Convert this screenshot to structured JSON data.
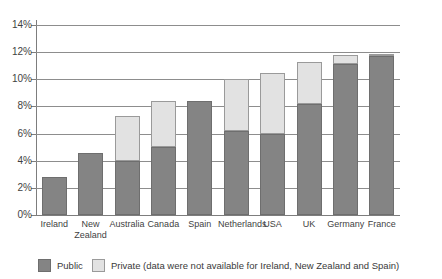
{
  "chart_data": {
    "type": "bar",
    "subtype": "stacked-bar",
    "title": "",
    "xlabel": "",
    "ylabel": "",
    "ylim": [
      0,
      14
    ],
    "ytick_step": 2,
    "ytick_labels": [
      "0%",
      "2%",
      "4%",
      "6%",
      "8%",
      "10%",
      "12%",
      "14%"
    ],
    "ytick_values": [
      0,
      2,
      4,
      6,
      8,
      10,
      12,
      14
    ],
    "grid": true,
    "legend_position": "bottom-left",
    "categories": [
      "Ireland",
      "New Zealand",
      "Australia",
      "Canada",
      "Spain",
      "Netherlands",
      "USA",
      "UK",
      "Germany",
      "France"
    ],
    "series": [
      {
        "name": "Public",
        "color": "#848484",
        "values": [
          2.8,
          4.6,
          4.0,
          5.0,
          8.4,
          6.2,
          6.0,
          8.2,
          11.1,
          11.7
        ]
      },
      {
        "name": "Private",
        "color": "#e2e2e2",
        "values": [
          0,
          0,
          3.3,
          3.4,
          0,
          3.8,
          4.5,
          3.1,
          0.7,
          0.15
        ]
      }
    ],
    "totals": [
      2.8,
      4.6,
      7.3,
      8.4,
      8.4,
      10.0,
      10.5,
      11.3,
      11.8,
      11.85
    ]
  },
  "legend": {
    "items": [
      {
        "label": "Public",
        "swatch": "public-swatch"
      },
      {
        "label": "Private (data were not available for Ireland, New Zealand and Spain)",
        "swatch": "private-swatch"
      }
    ]
  },
  "colors": {
    "public": "#848484",
    "private": "#e2e2e2",
    "gridline": "#8d8d8d",
    "axis": "#7d7d7d",
    "text": "#3f3f3f",
    "background": "#ffffff"
  }
}
